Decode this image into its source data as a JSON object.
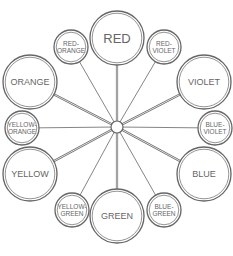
{
  "diagram": {
    "type": "color-wheel",
    "center": {
      "x": 117,
      "y": 127
    },
    "primary_and_secondary": [
      {
        "id": "red",
        "lines": [
          "RED"
        ],
        "x": 117,
        "y": 38
      },
      {
        "id": "violet",
        "lines": [
          "VIOLET"
        ],
        "x": 204,
        "y": 82
      },
      {
        "id": "blue",
        "lines": [
          "BLUE"
        ],
        "x": 204,
        "y": 174
      },
      {
        "id": "green",
        "lines": [
          "GREEN"
        ],
        "x": 117,
        "y": 216
      },
      {
        "id": "yellow",
        "lines": [
          "YELLOW"
        ],
        "x": 30,
        "y": 174
      },
      {
        "id": "orange",
        "lines": [
          "ORANGE"
        ],
        "x": 30,
        "y": 82
      }
    ],
    "tertiary": [
      {
        "id": "red-violet",
        "lines": [
          "RED-",
          "VIOLET"
        ],
        "x": 164,
        "y": 47
      },
      {
        "id": "blue-violet",
        "lines": [
          "BLUE-",
          "VIOLET"
        ],
        "x": 215,
        "y": 128
      },
      {
        "id": "blue-green",
        "lines": [
          "BLUE-",
          "GREEN"
        ],
        "x": 164,
        "y": 210
      },
      {
        "id": "yellow-green",
        "lines": [
          "YELLOW-",
          "GREEN"
        ],
        "x": 72,
        "y": 210
      },
      {
        "id": "yellow-orange",
        "lines": [
          "YELLOW-",
          "ORANGE"
        ],
        "x": 22,
        "y": 128
      },
      {
        "id": "red-orange",
        "lines": [
          "RED-",
          "ORANGE"
        ],
        "x": 71,
        "y": 47
      }
    ],
    "colors": {
      "stroke": "#666666",
      "text": "#666666",
      "background": "#ffffff"
    }
  }
}
